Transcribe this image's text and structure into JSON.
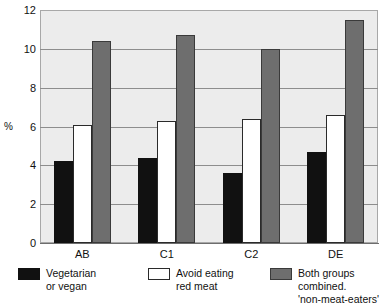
{
  "chart_data": {
    "type": "bar",
    "title": "",
    "subtitle": "",
    "xlabel": "",
    "ylabel": "%",
    "categories": [
      "AB",
      "C1",
      "C2",
      "DE"
    ],
    "series": [
      {
        "name": "Vegetarian\nor vegan",
        "values": [
          4.2,
          4.4,
          3.6,
          4.7
        ],
        "color": "#111111"
      },
      {
        "name": "Avoid eating\nred meat",
        "values": [
          6.1,
          6.3,
          6.4,
          6.6
        ],
        "color": "#ffffff"
      },
      {
        "name": "Both groups combined.\n'non-meat-eaters'",
        "values": [
          10.4,
          10.7,
          10.0,
          11.5
        ],
        "color": "#6e6e6e"
      }
    ],
    "ylim": [
      0,
      12
    ],
    "yticks": [
      0,
      2,
      4,
      6,
      8,
      10,
      12
    ],
    "ytick_labels": [
      "0",
      "2",
      "4",
      "6",
      "8",
      "10",
      "12"
    ],
    "grid": true,
    "grid_axis": "y",
    "legend_position": "bottom",
    "plot_background": "#ececec"
  },
  "legend": {
    "items": [
      {
        "label": "Vegetarian\nor vegan",
        "swatch": "black-swatch"
      },
      {
        "label": "Avoid eating\nred meat",
        "swatch": "white-swatch"
      },
      {
        "label": "Both groups combined.\n'non-meat-eaters'",
        "swatch": "grey-swatch"
      }
    ]
  }
}
